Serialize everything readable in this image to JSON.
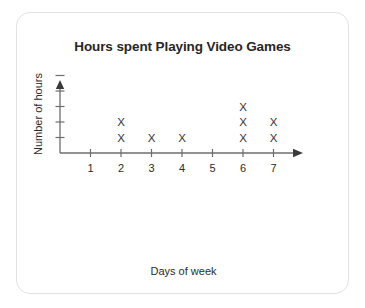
{
  "card": {
    "background_color": "#ffffff",
    "border_color": "#e2e2e2"
  },
  "chart_data": {
    "type": "scatter",
    "plot_style": "dot-plot-x-markers",
    "title": "Hours spent Playing Video Games",
    "xlabel": "Days of week",
    "ylabel": "Number of hours",
    "categories": [
      1,
      2,
      3,
      4,
      5,
      6,
      7
    ],
    "values": [
      0,
      2,
      1,
      1,
      0,
      3,
      2
    ],
    "series": [
      {
        "name": "Hours spent",
        "values": [
          0,
          2,
          1,
          1,
          0,
          3,
          2
        ]
      }
    ],
    "points": [
      {
        "x": 2,
        "y": 1
      },
      {
        "x": 2,
        "y": 2
      },
      {
        "x": 3,
        "y": 1
      },
      {
        "x": 4,
        "y": 1
      },
      {
        "x": 6,
        "y": 1
      },
      {
        "x": 6,
        "y": 2
      },
      {
        "x": 6,
        "y": 3
      },
      {
        "x": 7,
        "y": 1
      },
      {
        "x": 7,
        "y": 2
      }
    ],
    "marker": "X",
    "marker_color": "#333333",
    "axis_color": "#6e6e6e",
    "title_color": "#262626",
    "xticklabels": [
      "1",
      "2",
      "3",
      "4",
      "5",
      "6",
      "7"
    ],
    "yticklabels": [
      "",
      "",
      "",
      "",
      ""
    ],
    "ytick_count": 5,
    "xlim": [
      0,
      8
    ],
    "ylim": [
      0,
      5
    ],
    "grid": false,
    "legend": false,
    "x_axis_arrow": true,
    "y_axis_arrow": true
  }
}
